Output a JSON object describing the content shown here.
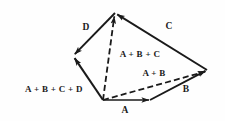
{
  "figure": {
    "width": 225,
    "height": 121,
    "background_color": "#fefefe",
    "stroke_color": "#1a1a1a"
  },
  "vertices": {
    "origin": {
      "name": "origin",
      "x": 103,
      "y": 100
    },
    "a_tip": {
      "name": "tip-of-A",
      "x": 150,
      "y": 100
    },
    "b_tip": {
      "name": "tip-of-B",
      "x": 207,
      "y": 70
    },
    "c_tip": {
      "name": "tip-of-C-apex",
      "x": 115,
      "y": 13
    },
    "d_tip": {
      "name": "tip-of-D",
      "x": 73,
      "y": 56
    }
  },
  "vectors": [
    {
      "id": "A",
      "label": "A",
      "style": "solid",
      "from": "origin",
      "to": "a_tip",
      "label_x": 125,
      "label_y": 111
    },
    {
      "id": "B",
      "label": "B",
      "style": "solid",
      "from": "a_tip",
      "to": "b_tip",
      "label_x": 186,
      "label_y": 90
    },
    {
      "id": "C",
      "label": "C",
      "style": "solid",
      "from": "b_tip",
      "to": "c_tip",
      "label_x": 169,
      "label_y": 27
    },
    {
      "id": "D",
      "label": "D",
      "style": "solid",
      "from": "c_tip",
      "to": "d_tip",
      "label_x": 86,
      "label_y": 28
    },
    {
      "id": "A_PLUS_B",
      "label": "A + B",
      "style": "dashed",
      "from": "origin",
      "to": "b_tip",
      "label_x": 154,
      "label_y": 73
    },
    {
      "id": "A_PLUS_B_PLUS_C",
      "label": "A + B + C",
      "style": "dashed",
      "from": "origin",
      "to": "c_tip",
      "label_x": 140,
      "label_y": 54
    },
    {
      "id": "A_PLUS_B_PLUS_C_PLUS_D",
      "label": "A + B + C + D",
      "style": "solid",
      "from": "origin",
      "to": "d_tip",
      "label_x": 54,
      "label_y": 89
    }
  ],
  "labels": {
    "a": "A",
    "b": "B",
    "c": "C",
    "d": "D",
    "a_plus_b": "A + B",
    "a_plus_b_plus_c": "A + B + C",
    "a_plus_b_plus_c_plus_d": "A + B + C + D"
  }
}
